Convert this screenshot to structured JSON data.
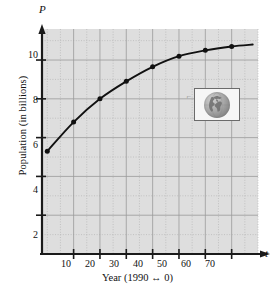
{
  "chart_data": {
    "type": "line",
    "title": "",
    "subtitle": "",
    "xlabel": "Year (1990 ↔ 0)",
    "ylabel": "Population (in billions)",
    "x_axis_symbol": "t",
    "y_axis_symbol": "P",
    "x": [
      0,
      10,
      20,
      30,
      40,
      50,
      60,
      70
    ],
    "values": [
      5.3,
      6.8,
      8.0,
      8.9,
      9.65,
      10.2,
      10.5,
      10.7
    ],
    "series": [
      {
        "name": "World population",
        "values": [
          5.3,
          6.8,
          8.0,
          8.9,
          9.65,
          10.2,
          10.5,
          10.7
        ]
      }
    ],
    "xlim": [
      -2,
      80
    ],
    "ylim": [
      0,
      11.6
    ],
    "xticks": [
      10,
      20,
      30,
      40,
      50,
      60,
      70
    ],
    "xtick_labels": [
      "10",
      "20",
      "30",
      "40",
      "50",
      "60",
      "70"
    ],
    "yticks": [
      2,
      4,
      6,
      8,
      10
    ],
    "ytick_labels": [
      "2",
      "4",
      "6",
      "8",
      "10"
    ],
    "x_minor_step": 5,
    "y_minor_step": 1,
    "grid": true,
    "grid_major": true,
    "grid_minor": true,
    "legend": false,
    "legend_position": "none",
    "markers": "filled-circle",
    "plot_background": "#dedede",
    "curve_color": "#111111",
    "grid_major_color": "#9a9a9a",
    "grid_minor_color": "#b5b5b5",
    "axis_color": "#1a1a1a"
  },
  "inset": {
    "name": "globe-image",
    "caption": ""
  }
}
